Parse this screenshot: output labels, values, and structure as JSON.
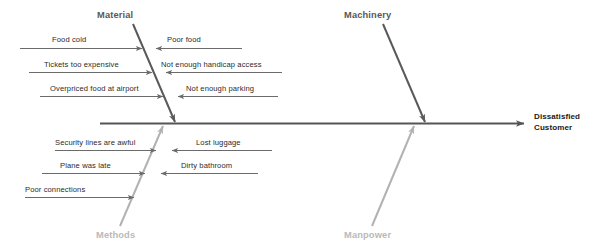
{
  "diagram": {
    "type": "fishbone-ishikawa",
    "effect": {
      "line1": "Dissatisfied",
      "line2": "Customer"
    },
    "colors": {
      "spine": "#555555",
      "bone_dark": "#5a5a5a",
      "bone_light": "#b2b2b2",
      "cause_arrow": "#6b6b6b",
      "text_dark": "#2b2b2b",
      "category_dark": "#595959",
      "category_light": "#b9b9b9",
      "background": "#ffffff"
    },
    "categories": [
      {
        "id": "material",
        "label": "Material",
        "position": "top-left",
        "tone": "dark",
        "causes": [
          {
            "text": "Food cold",
            "side": "left"
          },
          {
            "text": "Tickets too expensive",
            "side": "left"
          },
          {
            "text": "Overpriced food at airport",
            "side": "left"
          },
          {
            "text": "Poor food",
            "side": "right"
          },
          {
            "text": "Not enough handicap access",
            "side": "right"
          },
          {
            "text": "Not enough parking",
            "side": "right"
          }
        ]
      },
      {
        "id": "machinery",
        "label": "Machinery",
        "position": "top-right",
        "tone": "dark",
        "causes": []
      },
      {
        "id": "methods",
        "label": "Methods",
        "position": "bottom-left",
        "tone": "light",
        "causes": [
          {
            "text": "Security lines are awful",
            "side": "left"
          },
          {
            "text": "Plane was late",
            "side": "left"
          },
          {
            "text": "Poor connections",
            "side": "left"
          },
          {
            "text": "Lost luggage",
            "side": "right"
          },
          {
            "text": "Dirty bathroom",
            "side": "right"
          }
        ]
      },
      {
        "id": "manpower",
        "label": "Manpower",
        "position": "bottom-right",
        "tone": "light",
        "causes": []
      }
    ],
    "causes_flat": {
      "food_cold": "Food cold",
      "tickets_too_expensive": "Tickets too expensive",
      "overpriced_food_at_airport": "Overpriced food at airport",
      "poor_food": "Poor food",
      "not_enough_handicap_access": "Not enough handicap access",
      "not_enough_parking": "Not enough parking",
      "security_lines_are_awful": "Security lines are awful",
      "plane_was_late": "Plane was late",
      "poor_connections": "Poor connections",
      "lost_luggage": "Lost luggage",
      "dirty_bathroom": "Dirty bathroom"
    },
    "category_names": {
      "material": "Material",
      "machinery": "Machinery",
      "methods": "Methods",
      "manpower": "Manpower"
    }
  }
}
